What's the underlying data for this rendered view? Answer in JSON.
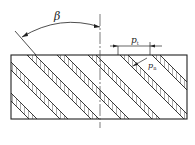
{
  "labels": {
    "angle": "β",
    "transverse_pitch": "p",
    "transverse_pitch_sub": "t",
    "normal_pitch": "p",
    "normal_pitch_sub": "n"
  },
  "colors": {
    "line": "#222222",
    "background": "#ffffff"
  }
}
